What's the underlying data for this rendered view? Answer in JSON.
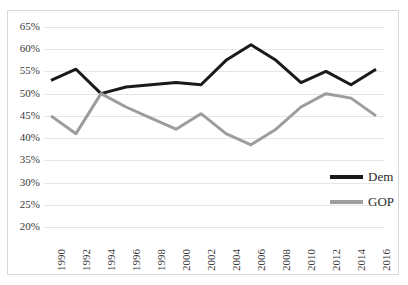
{
  "chart_data": {
    "type": "line",
    "title": "",
    "xlabel": "",
    "ylabel": "",
    "x": [
      1990,
      1992,
      1994,
      1996,
      1998,
      2000,
      2002,
      2004,
      2006,
      2008,
      2010,
      2012,
      2014,
      2016
    ],
    "xtick_labels": [
      "1990",
      "1992",
      "1994",
      "1996",
      "1998",
      "2000",
      "2002",
      "2004",
      "2006",
      "2008",
      "2010",
      "2012",
      "2014",
      "2016"
    ],
    "ytick_labels": [
      "65%",
      "60%",
      "55%",
      "50%",
      "45%",
      "40%",
      "35%",
      "30%",
      "25%",
      "20%"
    ],
    "ytick_values": [
      65,
      60,
      55,
      50,
      45,
      40,
      35,
      30,
      25,
      20
    ],
    "ylim": [
      20,
      65
    ],
    "xlim": [
      1990,
      2016
    ],
    "grid": true,
    "grid_axis": "y",
    "legend_position": "right-inside",
    "series": [
      {
        "name": "Dem",
        "color": "#1a1a1a",
        "line_width": 3,
        "values": [
          53.0,
          55.5,
          50.0,
          51.5,
          52.0,
          52.5,
          52.0,
          57.5,
          61.0,
          57.5,
          52.5,
          55.0,
          52.0,
          55.5
        ]
      },
      {
        "name": "GOP",
        "color": "#9d9d9d",
        "line_width": 3,
        "values": [
          45.0,
          41.0,
          50.0,
          47.0,
          44.5,
          42.0,
          45.5,
          41.0,
          38.5,
          42.0,
          47.0,
          50.0,
          49.0,
          45.0
        ]
      }
    ]
  },
  "legend": {
    "items": [
      {
        "label": "Dem",
        "color": "#1a1a1a"
      },
      {
        "label": "GOP",
        "color": "#9d9d9d"
      }
    ]
  }
}
